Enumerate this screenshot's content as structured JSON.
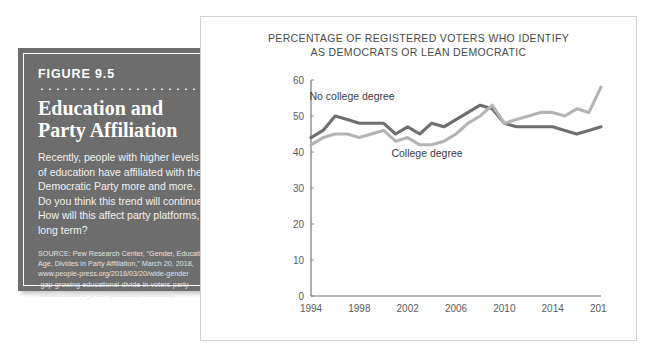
{
  "figure": {
    "number": "FIGURE 9.5",
    "title_lines": [
      "Education and",
      "Party Affiliation"
    ],
    "body_lines": [
      "Recently, people with higher levels",
      "of education have affiliated with the",
      "Democratic Party more and more.",
      "Do you think this trend will continue?",
      "How will this affect party platforms,",
      "long term?"
    ],
    "source_lines": [
      "SOURCE: Pew Research Center, “Gender, Education,",
      "Age, Divides in Party Affiliation,” March 20, 2018,",
      "www.people-press.org/2018/03/20/wide-gender",
      "-gap-growing-educational-divide-in-voters-party",
      "-identification/1_2-19/ (accessed 10/16/18)."
    ],
    "box_color": "#6d6d6d",
    "text_color": "#ffffff"
  },
  "chart_data": {
    "type": "line",
    "title": "PERCENTAGE OF REGISTERED VOTERS WHO IDENTIFY AS DEMOCRATS OR LEAN DEMOCRATIC",
    "title_lines": [
      "PERCENTAGE OF REGISTERED VOTERS WHO IDENTIFY",
      "AS DEMOCRATS OR LEAN DEMOCRATIC"
    ],
    "xlabel": "",
    "ylabel": "",
    "xlim": [
      1994,
      2018
    ],
    "ylim": [
      0,
      60
    ],
    "yticks": [
      0,
      10,
      20,
      30,
      40,
      50,
      60
    ],
    "xticks": [
      1994,
      1998,
      2002,
      2006,
      2010,
      2014,
      2018
    ],
    "grid": false,
    "legend": "inline-labels",
    "x": [
      1994,
      1995,
      1996,
      1997,
      1998,
      1999,
      2000,
      2001,
      2002,
      2003,
      2004,
      2005,
      2006,
      2007,
      2008,
      2009,
      2010,
      2011,
      2012,
      2013,
      2014,
      2015,
      2016,
      2017,
      2018
    ],
    "series": [
      {
        "name": "No college degree",
        "color": "#6e6e6e",
        "label_x": 1997.4,
        "label_y": 54.5,
        "values": [
          44,
          46,
          50,
          49,
          48,
          48,
          48,
          45,
          47,
          45,
          48,
          47,
          49,
          51,
          53,
          52,
          48,
          47,
          47,
          47,
          47,
          46,
          45,
          46,
          47
        ]
      },
      {
        "name": "College degree",
        "color": "#b4b4b4",
        "label_x": 2003.6,
        "label_y": 38.5,
        "values": [
          42,
          44,
          45,
          45,
          44,
          45,
          46,
          43,
          44,
          42,
          42,
          43,
          45,
          48,
          50,
          53,
          48,
          49,
          50,
          51,
          51,
          50,
          52,
          51,
          58
        ]
      }
    ]
  }
}
